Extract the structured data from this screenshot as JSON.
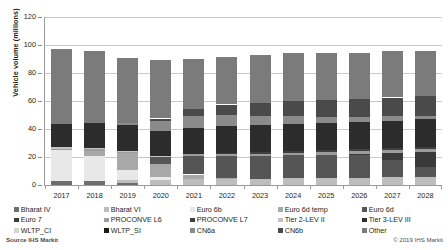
{
  "chart_data": {
    "type": "bar",
    "title": "",
    "subtitle": "",
    "stacked": true,
    "xlabel": "",
    "ylabel": "Vehicle volume (millions)",
    "ylim": [
      0,
      120
    ],
    "ytick_labels": [
      "0",
      "20",
      "40",
      "60",
      "80",
      "100",
      "120"
    ],
    "ytick_values": [
      0,
      20,
      40,
      60,
      80,
      100,
      120
    ],
    "grid": true,
    "legend_position": "bottom",
    "categories": [
      "2017",
      "2018",
      "2019",
      "2020",
      "2021",
      "2022",
      "2023",
      "2024",
      "2025",
      "2026",
      "2027",
      "2028"
    ],
    "totals": [
      97.0,
      95.5,
      91.0,
      89.0,
      90.2,
      91.5,
      93.0,
      94.0,
      94.5,
      94.5,
      95.5,
      96.0
    ],
    "series": [
      {
        "name": "Bharat IV",
        "color": "#6e6e6e",
        "values": [
          3.2,
          3.1,
          1.4,
          0.0,
          0.0,
          0.0,
          0.0,
          0.0,
          0.0,
          0.0,
          0.0,
          0.0
        ]
      },
      {
        "name": "Bharat VI",
        "color": "#bdbdbd",
        "values": [
          0.0,
          0.0,
          2.0,
          3.6,
          4.0,
          4.3,
          4.6,
          4.9,
          5.1,
          5.3,
          5.5,
          5.7
        ]
      },
      {
        "name": "Euro 6b",
        "color": "#e8e8e8",
        "values": [
          21.5,
          17.5,
          7.5,
          2.2,
          0.0,
          0.0,
          0.0,
          0.0,
          0.0,
          0.0,
          0.0,
          0.0
        ]
      },
      {
        "name": "Euro 6d temp",
        "color": "#a8a8a8",
        "values": [
          0.0,
          4.0,
          12.0,
          9.0,
          3.5,
          0.9,
          0.0,
          0.0,
          0.0,
          0.0,
          0.0,
          0.0
        ]
      },
      {
        "name": "Euro 6d",
        "color": "#555555",
        "values": [
          0.0,
          0.0,
          0.0,
          5.0,
          13.0,
          15.5,
          16.0,
          16.3,
          16.5,
          16.0,
          12.5,
          7.0
        ]
      },
      {
        "name": "Euro 7",
        "color": "#3a3a3a",
        "values": [
          0.0,
          0.0,
          0.0,
          0.0,
          0.0,
          0.0,
          0.0,
          0.0,
          0.0,
          1.0,
          5.0,
          11.0
        ]
      },
      {
        "name": "PROCONVE L6",
        "color": "#9c9c9c",
        "values": [
          1.2,
          1.3,
          1.3,
          0.9,
          1.5,
          1.7,
          1.8,
          1.9,
          1.9,
          2.0,
          2.0,
          2.1
        ]
      },
      {
        "name": "PROCONVE L7",
        "color": "#3f3f3f",
        "values": [
          0.0,
          0.0,
          0.0,
          0.0,
          0.0,
          0.6,
          1.0,
          1.1,
          1.2,
          1.3,
          1.4,
          1.5
        ]
      },
      {
        "name": "Tier 2-LEV II",
        "color": "#c4c4c4",
        "values": [
          0.9,
          0.6,
          0.4,
          0.2,
          0.0,
          0.0,
          0.0,
          0.0,
          0.0,
          0.0,
          0.0,
          0.0
        ]
      },
      {
        "name": "Tier 3-LEV III",
        "color": "#2c2c2c",
        "values": [
          16.5,
          17.8,
          18.5,
          17.6,
          18.5,
          19.0,
          19.2,
          19.3,
          19.4,
          19.5,
          19.6,
          19.8
        ]
      },
      {
        "name": "WLTP_CI",
        "color": "#d4d4d4",
        "values": [
          0.0,
          0.0,
          0.0,
          0.0,
          0.0,
          0.0,
          0.0,
          0.0,
          0.0,
          0.0,
          0.0,
          0.0
        ]
      },
      {
        "name": "WLTP_SI",
        "color": "#1a1a1a",
        "values": [
          0.0,
          0.0,
          0.0,
          0.0,
          0.0,
          0.0,
          0.0,
          0.0,
          0.0,
          0.0,
          0.0,
          0.0
        ]
      },
      {
        "name": "CN6a",
        "color": "#8a8a8a",
        "values": [
          0.0,
          0.0,
          1.5,
          7.5,
          9.0,
          8.0,
          6.5,
          5.5,
          4.5,
          3.5,
          3.0,
          2.5
        ]
      },
      {
        "name": "CN6b",
        "color": "#4a4a4a",
        "values": [
          0.0,
          0.0,
          0.0,
          1.5,
          4.5,
          7.5,
          9.5,
          11.0,
          12.0,
          13.0,
          13.5,
          14.0
        ]
      },
      {
        "name": "Other",
        "color": "#7b7b7b",
        "values": [
          53.7,
          51.2,
          46.4,
          41.5,
          36.2,
          34.0,
          34.4,
          34.0,
          33.9,
          32.9,
          33.0,
          32.4
        ]
      }
    ]
  },
  "axis": {
    "y_title": "Vehicle volume (millions)"
  },
  "legend": {
    "columns": [
      {
        "items": [
          {
            "label": "Bharat IV",
            "color": "#6e6e6e"
          },
          {
            "label": "Euro 7",
            "color": "#3a3a3a"
          },
          {
            "label": "WLTP_CI",
            "color": "#d4d4d4"
          }
        ]
      },
      {
        "items": [
          {
            "label": "Bharat VI",
            "color": "#bdbdbd"
          },
          {
            "label": "PROCONVE L6",
            "color": "#9c9c9c"
          },
          {
            "label": "WLTP_SI",
            "color": "#1a1a1a"
          }
        ]
      },
      {
        "items": [
          {
            "label": "Euro 6b",
            "color": "#e8e8e8"
          },
          {
            "label": "PROCONVE L7",
            "color": "#3f3f3f"
          },
          {
            "label": "CN6a",
            "color": "#8a8a8a"
          }
        ]
      },
      {
        "items": [
          {
            "label": "Euro 6d temp",
            "color": "#a8a8a8"
          },
          {
            "label": "Tier 2-LEV II",
            "color": "#c4c4c4"
          },
          {
            "label": "CN6b",
            "color": "#4a4a4a"
          }
        ]
      },
      {
        "items": [
          {
            "label": "Euro 6d",
            "color": "#555555"
          },
          {
            "label": "Tier 3-LEV III",
            "color": "#2c2c2c"
          },
          {
            "label": "Other",
            "color": "#7b7b7b"
          }
        ]
      }
    ]
  },
  "footer": {
    "source": "Source  IHS Markit",
    "copyright": "© 2019 IHS Markit"
  },
  "style": {
    "gridline_color": "#c9c9c9",
    "axis_color": "#9a9a9a",
    "text_color": "#231f20",
    "background": "#ffffff"
  }
}
